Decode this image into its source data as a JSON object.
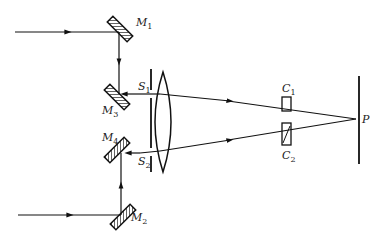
{
  "diagram": {
    "type": "optics-schematic",
    "mirrors": [
      {
        "id": "M1",
        "label": "M",
        "sub": "1"
      },
      {
        "id": "M2",
        "label": "M",
        "sub": "2"
      },
      {
        "id": "M3",
        "label": "M",
        "sub": "3"
      },
      {
        "id": "M4",
        "label": "M",
        "sub": "4"
      }
    ],
    "slits": [
      {
        "id": "S1",
        "label": "S",
        "sub": "1"
      },
      {
        "id": "S2",
        "label": "S",
        "sub": "2"
      }
    ],
    "cells": [
      {
        "id": "C1",
        "label": "C",
        "sub": "1"
      },
      {
        "id": "C2",
        "label": "C",
        "sub": "2"
      }
    ],
    "point": {
      "id": "P",
      "label": "P"
    },
    "colors": {
      "line": "#111111",
      "background": "#ffffff"
    }
  }
}
